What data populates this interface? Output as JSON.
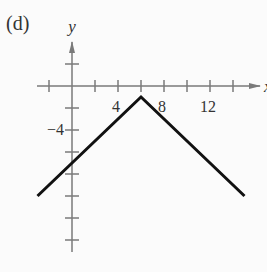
{
  "figure": {
    "panel_label": "(d)"
  },
  "chart_data": {
    "type": "line",
    "title": "(d)",
    "xlabel": "x",
    "ylabel": "y",
    "x_tick_labels": [
      "4",
      "8",
      "12"
    ],
    "y_tick_labels": [
      "-4"
    ],
    "x_tick_step": 2,
    "y_tick_step": 2,
    "xlim": [
      -3,
      16
    ],
    "ylim": [
      -15,
      3
    ],
    "grid": false,
    "legend": null,
    "series": [
      {
        "name": "f(x)",
        "x": [
          -3,
          6,
          15
        ],
        "y": [
          -10,
          -1,
          -10
        ]
      }
    ],
    "annotations": [
      "Vertex at (6, -1)",
      "y-intercept at (0, -7)"
    ]
  }
}
